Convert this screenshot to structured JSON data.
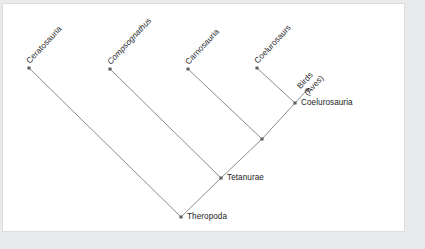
{
  "figure": {
    "type": "cladogram",
    "background_color": "#e9eaeb",
    "panel_color": "#ffffff",
    "line_color": "#8b8d90",
    "node_color": "#5e6063",
    "text_color": "#232427"
  },
  "taxa": {
    "ceratosauria": "Ceratosauria",
    "compsognathus": "Compsognathus",
    "carnosauria": "Carnosauria",
    "coelurosaurs": "Coelurosaurs",
    "birds": "Birds\n(Aves)",
    "coelurosauria": "Coelurosauria",
    "tetanurae": "Tetanurae",
    "theropoda": "Theropoda"
  },
  "chart_data": {
    "type": "diagram",
    "title": "",
    "nodes": [
      {
        "id": "ceratosauria",
        "label": "Ceratosauria",
        "kind": "tip",
        "x": 29,
        "y": 68,
        "label_style": "rotated"
      },
      {
        "id": "compsognathus",
        "label": "Compsognathus",
        "kind": "tip",
        "x": 110,
        "y": 69,
        "label_style": "rotated-italic"
      },
      {
        "id": "carnosauria",
        "label": "Carnosauria",
        "kind": "tip",
        "x": 188,
        "y": 69,
        "label_style": "rotated"
      },
      {
        "id": "coelurosaurs",
        "label": "Coelurosaurs",
        "kind": "tip",
        "x": 257,
        "y": 68,
        "label_style": "rotated"
      },
      {
        "id": "birds",
        "label": "Birds (Aves)",
        "kind": "tip",
        "x": 307,
        "y": 90,
        "label_style": "rotated-two-line"
      },
      {
        "id": "coelurosauria",
        "label": "Coelurosauria",
        "kind": "internal",
        "x": 295,
        "y": 103,
        "label_style": "horizontal"
      },
      {
        "id": "unnamed_clade",
        "label": "",
        "kind": "internal",
        "x": 262,
        "y": 139,
        "label_style": "none"
      },
      {
        "id": "tetanurae",
        "label": "Tetanurae",
        "kind": "internal",
        "x": 221,
        "y": 178,
        "label_style": "horizontal"
      },
      {
        "id": "theropoda",
        "label": "Theropoda",
        "kind": "root",
        "x": 181,
        "y": 217,
        "label_style": "horizontal"
      }
    ],
    "edges": [
      {
        "from": "theropoda",
        "to": "ceratosauria"
      },
      {
        "from": "theropoda",
        "to": "tetanurae"
      },
      {
        "from": "tetanurae",
        "to": "compsognathus"
      },
      {
        "from": "tetanurae",
        "to": "unnamed_clade"
      },
      {
        "from": "unnamed_clade",
        "to": "carnosauria"
      },
      {
        "from": "unnamed_clade",
        "to": "coelurosauria"
      },
      {
        "from": "coelurosauria",
        "to": "coelurosaurs"
      },
      {
        "from": "coelurosauria",
        "to": "birds"
      }
    ]
  }
}
